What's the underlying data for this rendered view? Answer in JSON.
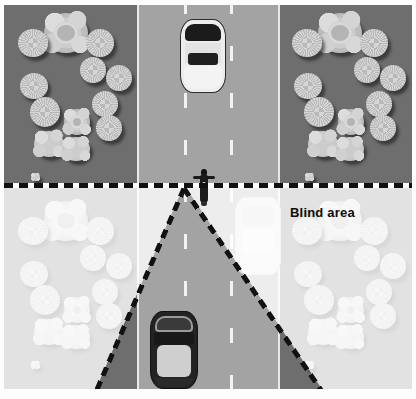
{
  "figure": {
    "width": 416,
    "height": 399
  },
  "labels": {
    "blind_area": "Blind area"
  },
  "colors": {
    "ground": "#6e6e6e",
    "road": "#a3a3a3",
    "lane_marking": "#f2f2f2",
    "boundary_dash": "#111111",
    "washout_overlay": "#ffffff",
    "white_car": "#ededed",
    "dark_car": "#232323",
    "motorcycle": "#1a1a1a"
  },
  "scene": {
    "regions": [
      {
        "name": "vegetation-left",
        "description": "aerial view of trees on dark ground"
      },
      {
        "name": "roadway-center",
        "description": "three-lane asphalt road with dashed lane markings"
      },
      {
        "name": "vegetation-right",
        "description": "aerial view of trees on dark ground"
      },
      {
        "name": "blind-area-wedge",
        "description": "triangular cone of vision originating at the motorcycle"
      },
      {
        "name": "washed-out-area",
        "description": "overexposed region outside the blind area"
      }
    ],
    "vehicles": [
      {
        "name": "white-car",
        "lane": "center",
        "position": "ahead of motorcycle",
        "color": "#ededed"
      },
      {
        "name": "motorcycle",
        "lane": "center",
        "position": "apex of blind area",
        "color": "#1a1a1a"
      },
      {
        "name": "dark-car",
        "lane": "center",
        "position": "behind motorcycle",
        "color": "#232323"
      },
      {
        "name": "ghost-car",
        "lane": "right",
        "position": "edge of blind area",
        "color": "#e6e6e6"
      }
    ],
    "road": {
      "lanes": 3,
      "lane_marking_style": "dashed",
      "edge_line_style": "solid"
    }
  }
}
